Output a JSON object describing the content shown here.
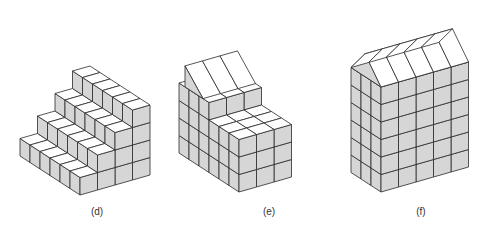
{
  "figures": [
    {
      "id": "d",
      "label": "(d)",
      "description": "Stepped staircase of unit cubes, 4 steps"
    },
    {
      "id": "e",
      "label": "(e)",
      "description": "Block of cubes with raised back section and sloped roof"
    },
    {
      "id": "f",
      "label": "(f)",
      "description": "House-shaped block of cubes with gabled roof"
    }
  ],
  "colors": {
    "top_face": "#ffffff",
    "side_face": "#d6d6d6",
    "edge": "#2a2a2a",
    "background": "#ffffff"
  }
}
